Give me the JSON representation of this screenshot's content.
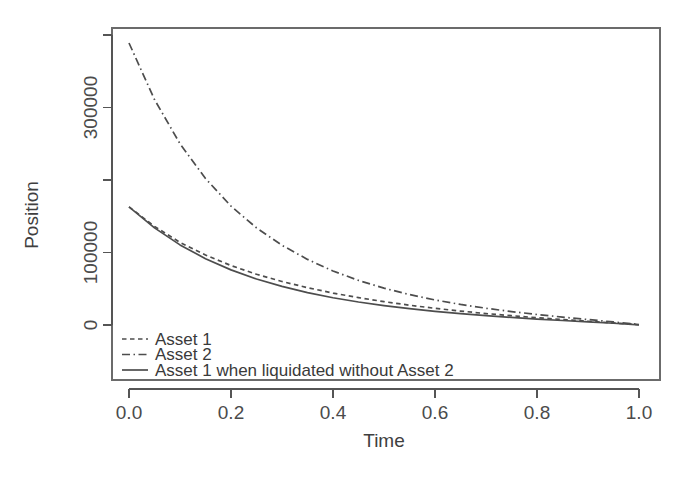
{
  "chart_data": {
    "type": "line",
    "title": "",
    "xlabel": "Time",
    "ylabel": "Position",
    "xlim": [
      0.0,
      1.0
    ],
    "ylim": [
      0,
      400000
    ],
    "grid": false,
    "legend_position": "bottom-left",
    "x_ticks": [
      {
        "value": 0.0,
        "label": "0.0"
      },
      {
        "value": 0.2,
        "label": "0.2"
      },
      {
        "value": 0.4,
        "label": "0.4"
      },
      {
        "value": 0.6,
        "label": "0.6"
      },
      {
        "value": 0.8,
        "label": "0.8"
      },
      {
        "value": 1.0,
        "label": "1.0"
      }
    ],
    "y_ticks": [
      {
        "value": 0,
        "label": "0"
      },
      {
        "value": 100000,
        "label": "100000"
      },
      {
        "value": 200000,
        "label": ""
      },
      {
        "value": 300000,
        "label": "300000"
      },
      {
        "value": 400000,
        "label": ""
      }
    ],
    "x": [
      0.0,
      0.05,
      0.1,
      0.15,
      0.2,
      0.25,
      0.3,
      0.35,
      0.4,
      0.45,
      0.5,
      0.55,
      0.6,
      0.65,
      0.7,
      0.75,
      0.8,
      0.85,
      0.9,
      0.95,
      1.0
    ],
    "series": [
      {
        "name": "Asset 1",
        "line_style": "dashed",
        "values": [
          163000,
          136000,
          114000,
          96500,
          82000,
          70000,
          60000,
          51500,
          44000,
          37800,
          32200,
          27300,
          23000,
          19200,
          15800,
          12800,
          10100,
          7600,
          5200,
          2800,
          400
        ]
      },
      {
        "name": "Asset 2",
        "line_style": "dashdot",
        "values": [
          389000,
          311000,
          250000,
          202000,
          164000,
          134000,
          110000,
          90500,
          74500,
          61500,
          50800,
          42000,
          34600,
          28400,
          23100,
          18500,
          14500,
          10900,
          7500,
          4200,
          900
        ]
      },
      {
        "name": "Asset 1 when liquidated without Asset 2",
        "line_style": "solid",
        "values": [
          163000,
          134000,
          110500,
          91500,
          76000,
          63500,
          53200,
          44700,
          37600,
          31700,
          26700,
          22500,
          18900,
          15700,
          12900,
          10400,
          8200,
          6200,
          4300,
          2400,
          300
        ]
      }
    ],
    "legend": [
      {
        "label": "Asset 1",
        "line_style": "dashed"
      },
      {
        "label": "Asset 2",
        "line_style": "dashdot"
      },
      {
        "label": "Asset 1 when liquidated without Asset 2",
        "line_style": "solid"
      }
    ],
    "colors": {
      "line": "#4d4d4d",
      "axis": "#555555",
      "frame": "#6b6b6b",
      "text": "#3f3f3f",
      "background": "#ffffff"
    }
  }
}
